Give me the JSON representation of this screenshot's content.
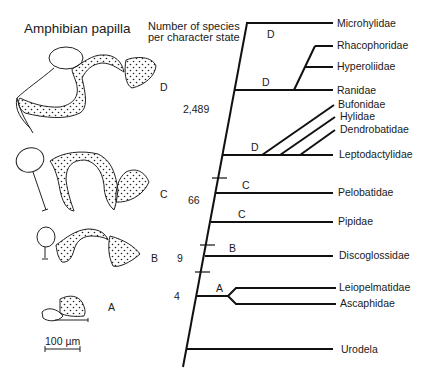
{
  "figure": {
    "left_panel_title": "Amphibian papilla",
    "column_header_line1": "Number of species",
    "column_header_line2": "per character state",
    "scale_bar_label": "100 µm",
    "papilla_states": [
      {
        "label": "D",
        "species_count": "2,489"
      },
      {
        "label": "C",
        "species_count": "66"
      },
      {
        "label": "B",
        "species_count": "9"
      },
      {
        "label": "A",
        "species_count": "4"
      }
    ],
    "branch_state_labels": [
      "D",
      "D",
      "D",
      "C",
      "C",
      "B",
      "A"
    ],
    "taxa": [
      "Microhylidae",
      "Rhacophoridae",
      "Hyperoliidae",
      "Ranidae",
      "Bufonidae",
      "Hylidae",
      "Dendrobatidae",
      "Leptodactylidae",
      "Pelobatidae",
      "Pipidae",
      "Discoglossidae",
      "Leiopelmatidae",
      "Ascaphidae",
      "Urodela"
    ]
  }
}
